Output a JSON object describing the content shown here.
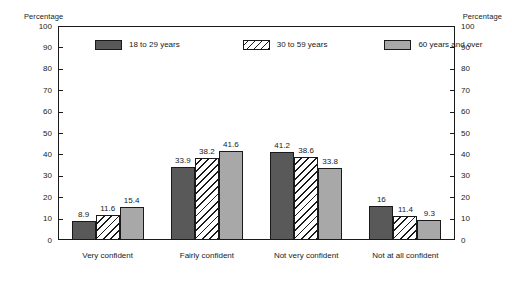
{
  "chart_data": {
    "type": "bar",
    "title": "",
    "xlabel": "",
    "ylabel": "Percentage",
    "ylabel_right": "Percentage",
    "ylim": [
      0,
      100
    ],
    "yticks": [
      0,
      10,
      20,
      30,
      40,
      50,
      60,
      70,
      80,
      90,
      100
    ],
    "grid": false,
    "legend_position": "top-inside",
    "categories": [
      "Very confident",
      "Fairly confident",
      "Not very confident",
      "Not at all confident"
    ],
    "series": [
      {
        "name": "18 to 29 years",
        "color": "#595959",
        "pattern": "solid-dark",
        "values": [
          8.9,
          33.9,
          41.2,
          16
        ],
        "labels": [
          "8.9",
          "33.9",
          "41.2",
          "16"
        ]
      },
      {
        "name": "30 to 59 years",
        "color": "#ffffff",
        "pattern": "diagonal-hatch",
        "values": [
          11.6,
          38.2,
          38.6,
          11.4
        ],
        "labels": [
          "11.6",
          "38.2",
          "38.6",
          "11.4"
        ]
      },
      {
        "name": "60 years and over",
        "color": "#a8a8a8",
        "pattern": "solid-light",
        "values": [
          15.4,
          41.6,
          33.8,
          9.3
        ],
        "labels": [
          "15.4",
          "41.6",
          "33.8",
          "9.3"
        ]
      }
    ]
  },
  "axis": {
    "left_title": "Percentage",
    "right_title": "Percentage",
    "tick_labels": [
      "100",
      "90",
      "80",
      "70",
      "60",
      "50",
      "40",
      "30",
      "20",
      "10",
      "0"
    ]
  },
  "colors": {
    "series_18_29": "#595959",
    "series_30_59": "#ffffff",
    "series_60_over": "#a8a8a8",
    "axis_line": "#1a1a1a",
    "background": "#ffffff"
  }
}
